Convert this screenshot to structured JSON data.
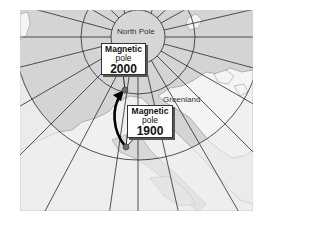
{
  "map": {
    "title": "",
    "labels": {
      "north_pole": "North Pole",
      "greenland": "Greenland"
    },
    "magnetic_pole_2000": {
      "line1": "Magnetic",
      "line2": "pole",
      "year": "2000"
    },
    "magnetic_pole_1900": {
      "line1": "Magnetic",
      "line2": "pole",
      "year": "1900"
    },
    "colors": {
      "ocean_inside_circle": "#d6d6d6",
      "land": "#f2f2f2",
      "outside_circle": "#e6e6e6",
      "grid_lines": "#2a2a2a",
      "pole_dot": "#6e6e6e",
      "arrow": "#000000"
    },
    "grid": {
      "center": [
        138,
        37
      ],
      "circle_radii": [
        27,
        57,
        123
      ],
      "meridian_count": 24
    }
  }
}
